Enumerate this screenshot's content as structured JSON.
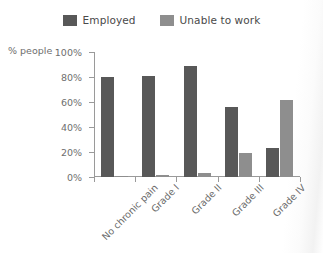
{
  "legend": {
    "items": [
      {
        "label": "Employed",
        "color": "#585858",
        "icon": "legend-swatch-icon"
      },
      {
        "label": "Unable to work",
        "color": "#8e8e8e",
        "icon": "legend-swatch-icon"
      }
    ]
  },
  "axis": {
    "ylabel": "% people",
    "yticks": [
      "100%",
      "80%",
      "60%",
      "40%",
      "20%",
      "0%"
    ]
  },
  "chart_data": {
    "type": "bar",
    "title": "",
    "xlabel": "",
    "ylabel": "% people",
    "ylim": [
      0,
      100
    ],
    "ytick_values": [
      0,
      20,
      40,
      60,
      80,
      100
    ],
    "ytick_labels": [
      "0%",
      "20%",
      "40%",
      "60%",
      "80%",
      "100%"
    ],
    "grid": false,
    "legend_position": "top-center",
    "categories": [
      "No chronic pain",
      "Grade I",
      "Grade II",
      "Grade III",
      "Grade IV"
    ],
    "series": [
      {
        "name": "Employed",
        "color": "#585858",
        "values": [
          80,
          81,
          89,
          56,
          23
        ]
      },
      {
        "name": "Unable to work",
        "color": "#8e8e8e",
        "values": [
          1,
          2,
          3,
          19,
          62
        ]
      }
    ]
  }
}
